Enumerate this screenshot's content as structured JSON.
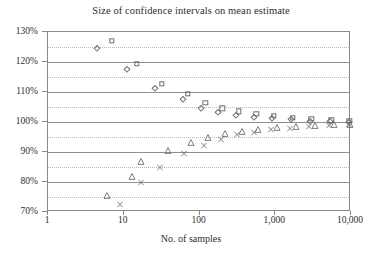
{
  "chart_data": {
    "type": "scatter",
    "title": "Size of confidence intervals on mean estimate",
    "xlabel": "No. of samples",
    "ylabel": "",
    "xscale": "log",
    "xlim": [
      1,
      10000
    ],
    "ylim": [
      70,
      130
    ],
    "grid": "horizontal major solid at 10% steps, dotted minor at 5% steps",
    "legend": "none",
    "xtick_labels": [
      "1",
      "10",
      "100",
      "1,000",
      "10,000"
    ],
    "xtick_values": [
      1,
      10,
      100,
      1000,
      10000
    ],
    "ytick_labels": [
      "70%",
      "80%",
      "90%",
      "100%",
      "110%",
      "120%",
      "130%"
    ],
    "ytick_values": [
      70,
      80,
      90,
      100,
      110,
      120,
      130
    ],
    "yminor_values": [
      75,
      85,
      95,
      105,
      115,
      125
    ],
    "series": [
      {
        "name": "upper-outer",
        "marker": "square",
        "points": [
          {
            "x": 7,
            "y": 127.0
          },
          {
            "x": 15,
            "y": 119.5
          },
          {
            "x": 32,
            "y": 112.8
          },
          {
            "x": 70,
            "y": 109.5
          },
          {
            "x": 120,
            "y": 106.5
          },
          {
            "x": 200,
            "y": 104.6
          },
          {
            "x": 330,
            "y": 103.6
          },
          {
            "x": 560,
            "y": 102.8
          },
          {
            "x": 950,
            "y": 102.0
          },
          {
            "x": 1700,
            "y": 101.4
          },
          {
            "x": 3000,
            "y": 101.0
          },
          {
            "x": 5500,
            "y": 100.6
          },
          {
            "x": 9500,
            "y": 100.3
          }
        ]
      },
      {
        "name": "upper-inner",
        "marker": "diamond",
        "points": [
          {
            "x": 4.5,
            "y": 124.7
          },
          {
            "x": 11,
            "y": 117.6
          },
          {
            "x": 26,
            "y": 111.4
          },
          {
            "x": 60,
            "y": 107.6
          },
          {
            "x": 105,
            "y": 104.8
          },
          {
            "x": 175,
            "y": 103.2
          },
          {
            "x": 300,
            "y": 102.4
          },
          {
            "x": 520,
            "y": 101.8
          },
          {
            "x": 900,
            "y": 101.2
          },
          {
            "x": 1600,
            "y": 100.9
          },
          {
            "x": 2900,
            "y": 100.5
          },
          {
            "x": 5300,
            "y": 100.2
          },
          {
            "x": 9300,
            "y": 100.0
          }
        ]
      },
      {
        "name": "lower-inner",
        "marker": "triangle",
        "points": [
          {
            "x": 6,
            "y": 76.0
          },
          {
            "x": 13,
            "y": 82.2
          },
          {
            "x": 17,
            "y": 87.5
          },
          {
            "x": 38,
            "y": 91.0
          },
          {
            "x": 78,
            "y": 93.6
          },
          {
            "x": 130,
            "y": 95.4
          },
          {
            "x": 215,
            "y": 96.6
          },
          {
            "x": 360,
            "y": 97.4
          },
          {
            "x": 600,
            "y": 98.1
          },
          {
            "x": 1050,
            "y": 98.6
          },
          {
            "x": 1900,
            "y": 99.0
          },
          {
            "x": 3300,
            "y": 99.4
          },
          {
            "x": 6000,
            "y": 99.6
          },
          {
            "x": 9700,
            "y": 99.8
          }
        ]
      },
      {
        "name": "lower-outer",
        "marker": "cross",
        "points": [
          {
            "x": 9,
            "y": 73.0
          },
          {
            "x": 17,
            "y": 80.3
          },
          {
            "x": 30,
            "y": 85.5
          },
          {
            "x": 62,
            "y": 90.0
          },
          {
            "x": 115,
            "y": 92.8
          },
          {
            "x": 190,
            "y": 94.8
          },
          {
            "x": 310,
            "y": 96.2
          },
          {
            "x": 520,
            "y": 97.1
          },
          {
            "x": 880,
            "y": 97.9
          },
          {
            "x": 1550,
            "y": 98.5
          },
          {
            "x": 2800,
            "y": 98.9
          },
          {
            "x": 5200,
            "y": 99.3
          },
          {
            "x": 9400,
            "y": 99.6
          }
        ]
      }
    ]
  },
  "colors": {
    "axis": "#8a8a8a",
    "gridline_major": "#8f8f8f",
    "gridline_minor": "#b9b9b9",
    "marker": "#6e6e6e",
    "text": "#2e2e2e",
    "background": "#ffffff"
  }
}
